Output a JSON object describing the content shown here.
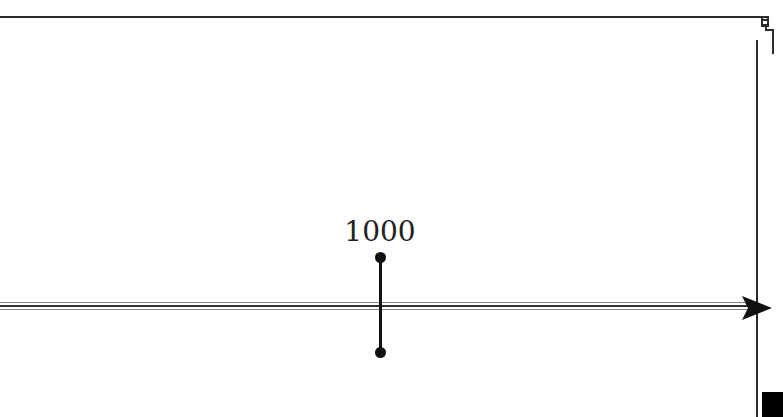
{
  "diagram": {
    "type": "timeline",
    "events": [
      {
        "label": "1000"
      }
    ],
    "colors": {
      "line": "#2a2a2a",
      "marker": "#111111",
      "background": "#ffffff"
    }
  }
}
